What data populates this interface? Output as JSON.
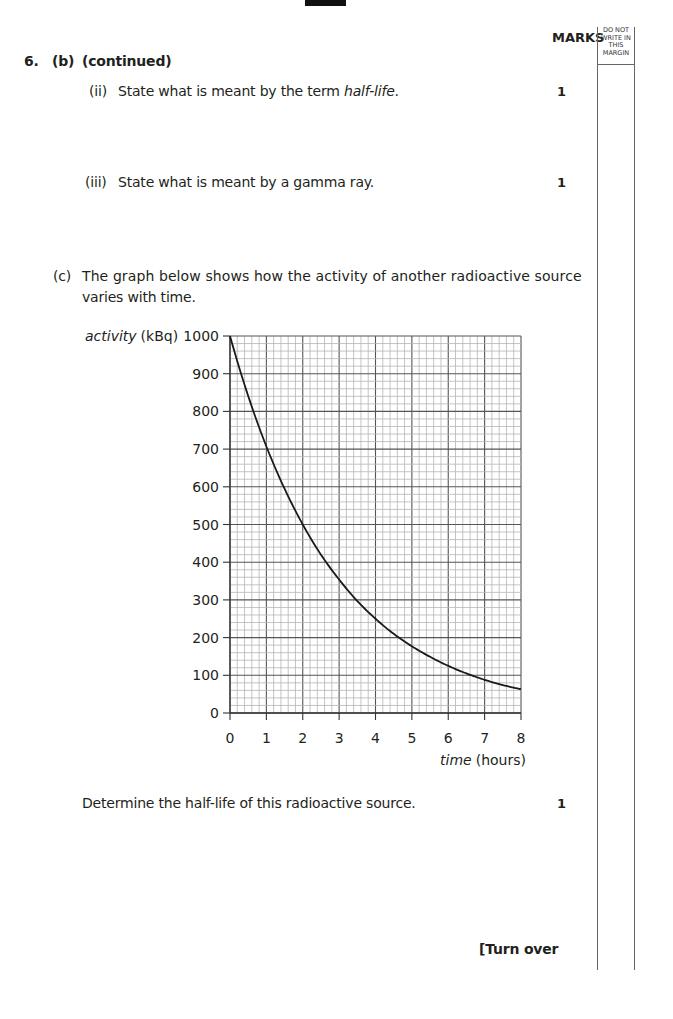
{
  "header": {
    "marks_label": "MARKS",
    "margin_label": [
      "DO NOT",
      "WRITE IN",
      "THIS",
      "MARGIN"
    ]
  },
  "question": {
    "number": "6.",
    "part": "(b)",
    "continued": "(continued)",
    "items": [
      {
        "label": "(ii)",
        "text_before": "State what is meant by the term ",
        "text_italic": "half-life",
        "text_after": ".",
        "marks": "1"
      },
      {
        "label": "(iii)",
        "text": "State what is meant by a gamma ray.",
        "marks": "1"
      }
    ],
    "part_c": {
      "label": "(c)",
      "line1": "The graph below shows how the activity of another radioactive source",
      "line2": "varies with time.",
      "prompt": "Determine the half-life of this radioactive source.",
      "marks": "1"
    }
  },
  "footer": {
    "turn_over": "[Turn over"
  },
  "chart_data": {
    "type": "line",
    "title": "",
    "xlabel_italic": "time",
    "xlabel_unit": "(hours)",
    "ylabel_italic": "activity",
    "ylabel_unit": "(kBq)",
    "xlim": [
      0,
      8
    ],
    "ylim": [
      0,
      1000
    ],
    "x_ticks": [
      "0",
      "1",
      "2",
      "3",
      "4",
      "5",
      "6",
      "7",
      "8"
    ],
    "y_ticks": [
      "0",
      "100",
      "200",
      "300",
      "400",
      "500",
      "600",
      "700",
      "800",
      "900",
      "1000"
    ],
    "grid": {
      "major_x_step": 1,
      "minor_x_per_major": 5,
      "major_y_step": 100,
      "minor_y_per_major": 5
    },
    "legend": "none",
    "series": [
      {
        "name": "activity",
        "x": [
          0,
          0.5,
          1,
          1.5,
          2,
          2.5,
          3,
          3.5,
          4,
          4.5,
          5,
          5.5,
          6,
          6.5,
          7,
          7.5,
          8
        ],
        "y": [
          1000,
          841,
          707,
          595,
          500,
          420,
          354,
          297,
          250,
          210,
          177,
          149,
          125,
          105,
          88,
          74,
          63
        ]
      }
    ]
  }
}
